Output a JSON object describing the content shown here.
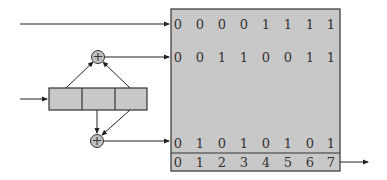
{
  "diagram": {
    "type": "lfsr-sequence-table",
    "register": {
      "cells": 3
    },
    "xor_nodes": [
      {
        "id": "top",
        "symbol": "+"
      },
      {
        "id": "bottom",
        "symbol": "+"
      }
    ],
    "table": {
      "rows": [
        [
          "0",
          "0",
          "0",
          "0",
          "1",
          "1",
          "1",
          "1"
        ],
        [
          "0",
          "0",
          "1",
          "1",
          "0",
          "0",
          "1",
          "1"
        ],
        [
          "0",
          "1",
          "0",
          "1",
          "0",
          "1",
          "0",
          "1"
        ]
      ],
      "index_row": [
        "0",
        "1",
        "2",
        "3",
        "4",
        "5",
        "6",
        "7"
      ]
    },
    "colors": {
      "fill": "#c8c8c8",
      "stroke": "#333333",
      "xor_fill": "#c0c0c0"
    }
  }
}
